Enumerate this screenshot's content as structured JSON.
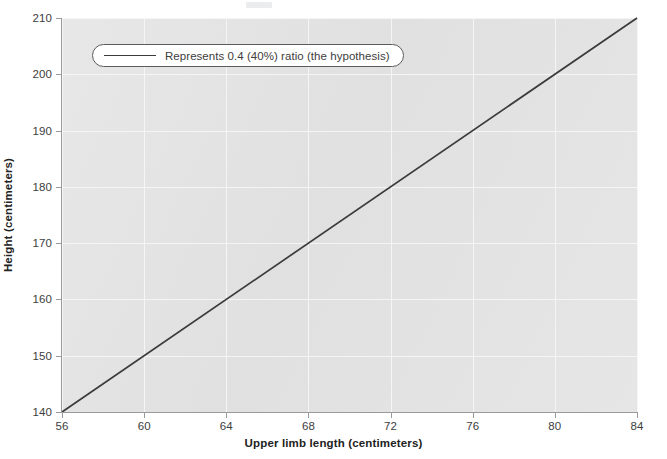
{
  "chart_data": {
    "type": "line",
    "title": "",
    "xlabel": "Upper limb length (centimeters)",
    "ylabel": "Height (centimeters)",
    "xlim": [
      56,
      84
    ],
    "ylim": [
      140,
      210
    ],
    "xticks": [
      56,
      60,
      64,
      68,
      72,
      76,
      80,
      84
    ],
    "yticks": [
      140,
      150,
      160,
      170,
      180,
      190,
      200,
      210
    ],
    "grid": true,
    "legend_position": "upper left",
    "series": [
      {
        "name": "Represents 0.4 (40%) ratio (the hypothesis)",
        "x": [
          56,
          84
        ],
        "values": [
          140,
          210
        ],
        "color": "#3b3b3b",
        "ratio": 0.4
      }
    ]
  },
  "axes": {
    "x": {
      "title": "Upper limb length (centimeters)",
      "ticks": [
        "56",
        "60",
        "64",
        "68",
        "72",
        "76",
        "80",
        "84"
      ]
    },
    "y": {
      "title": "Height (centimeters)",
      "ticks": [
        "140",
        "150",
        "160",
        "170",
        "180",
        "190",
        "200",
        "210"
      ]
    }
  },
  "legend": {
    "entries": [
      {
        "label": "Represents 0.4 (40%) ratio (the hypothesis)",
        "swatch": "line-swatch-icon"
      }
    ]
  },
  "colors": {
    "plot_background": "#e3e3e3",
    "page_background": "#ffffff",
    "gridline": "#f5f5f5",
    "axis": "#9a9a9a",
    "line": "#3b3b3b",
    "text": "#3d3d3d",
    "title_text": "#222222"
  }
}
